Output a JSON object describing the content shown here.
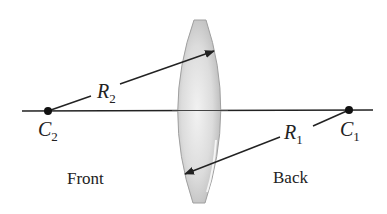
{
  "diagram": {
    "type": "biconvex-lens-radii-of-curvature",
    "labels": {
      "r2": {
        "symbol": "R",
        "subscript": "2"
      },
      "r1": {
        "symbol": "R",
        "subscript": "1"
      },
      "c2": {
        "symbol": "C",
        "subscript": "2"
      },
      "c1": {
        "symbol": "C",
        "subscript": "1"
      },
      "front": "Front",
      "back": "Back"
    },
    "colors": {
      "line": "#222222",
      "lens_fill": "#d9d9d9",
      "lens_edge": "#9a9a9a",
      "background": "#ffffff"
    }
  }
}
